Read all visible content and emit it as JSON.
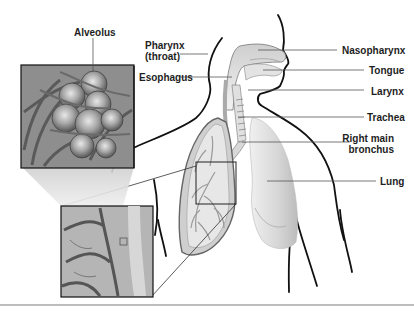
{
  "diagram": {
    "labels": {
      "alveolus": "Alveolus",
      "pharynx_line1": "Pharynx",
      "pharynx_line2": "(throat)",
      "esophagus": "Esophagus",
      "nasopharynx": "Nasopharynx",
      "tongue": "Tongue",
      "larynx": "Larynx",
      "trachea": "Trachea",
      "bronchus_line1": "Right main",
      "bronchus_line2": "bronchus",
      "lung": "Lung"
    },
    "colors": {
      "outline": "#111111",
      "leader": "#555555",
      "lung_fill": "#d9d9d9",
      "inset_fill": "#9a9a9a",
      "background": "#ffffff"
    }
  }
}
